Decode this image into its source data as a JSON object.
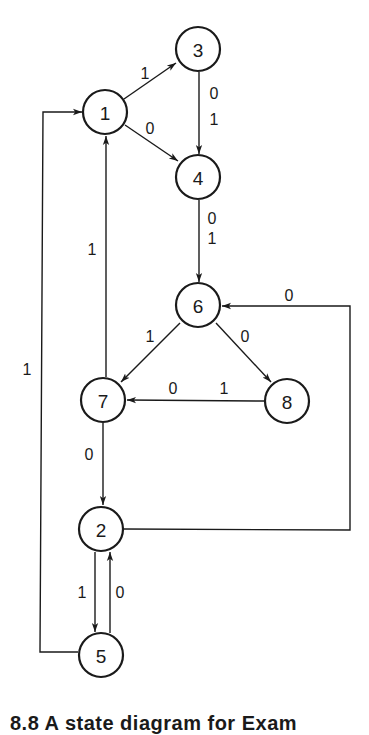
{
  "diagram": {
    "type": "state-diagram",
    "colors": {
      "stroke": "#1a1a1a",
      "background": "#ffffff"
    },
    "nodes": [
      {
        "id": "1",
        "label": "1",
        "x": 105,
        "y": 112
      },
      {
        "id": "2",
        "label": "2",
        "x": 101,
        "y": 529
      },
      {
        "id": "3",
        "label": "3",
        "x": 198,
        "y": 49
      },
      {
        "id": "4",
        "label": "4",
        "x": 198,
        "y": 177
      },
      {
        "id": "5",
        "label": "5",
        "x": 101,
        "y": 655
      },
      {
        "id": "6",
        "label": "6",
        "x": 198,
        "y": 305
      },
      {
        "id": "7",
        "label": "7",
        "x": 103,
        "y": 400
      },
      {
        "id": "8",
        "label": "8",
        "x": 287,
        "y": 401
      }
    ],
    "edges": [
      {
        "from": "1",
        "to": "3",
        "label": "1"
      },
      {
        "from": "1",
        "to": "4",
        "label": "0"
      },
      {
        "from": "3",
        "to": "4",
        "label": "0\n1",
        "label_top": "0",
        "label_bottom": "1"
      },
      {
        "from": "4",
        "to": "6",
        "label": "0\n1",
        "label_top": "0",
        "label_bottom": "1"
      },
      {
        "from": "6",
        "to": "7",
        "label": "1"
      },
      {
        "from": "6",
        "to": "8",
        "label": "0"
      },
      {
        "from": "8",
        "to": "7",
        "label": "0 1",
        "label_left": "0",
        "label_right": "1"
      },
      {
        "from": "7",
        "to": "1",
        "label": "1"
      },
      {
        "from": "7",
        "to": "2",
        "label": "0"
      },
      {
        "from": "2",
        "to": "6",
        "label": "0"
      },
      {
        "from": "2",
        "to": "5",
        "label": "1"
      },
      {
        "from": "5",
        "to": "2",
        "label": "0"
      },
      {
        "from": "5",
        "to": "1",
        "label": "1"
      }
    ],
    "caption": "8.8  A state diagram for Exam"
  }
}
